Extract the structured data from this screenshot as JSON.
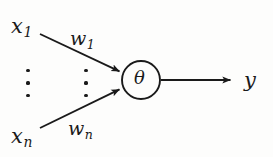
{
  "figure": {
    "kind": "neuron-diagram",
    "caption": "",
    "background_color": "#fdfdfc",
    "ink_color": "#1a1a1a"
  },
  "inputs": {
    "first": {
      "base": "x",
      "subscript": "1"
    },
    "last": {
      "base": "x",
      "subscript": "n"
    },
    "ellipsis_dots": 3
  },
  "weights": {
    "first": {
      "base": "w",
      "subscript": "1"
    },
    "last": {
      "base": "w",
      "subscript": "n"
    },
    "ellipsis_dots": 3
  },
  "node": {
    "symbol": "θ",
    "shape": "circle",
    "center_x": 141,
    "center_y": 80,
    "radius": 19
  },
  "output": {
    "symbol": "y"
  },
  "edges": [
    {
      "name": "input-1-to-node",
      "from_x": 40,
      "from_y": 34,
      "to_x": 121,
      "to_y": 72,
      "arrowhead": true
    },
    {
      "name": "input-n-to-node",
      "from_x": 40,
      "from_y": 128,
      "to_x": 121,
      "to_y": 89,
      "arrowhead": true
    },
    {
      "name": "node-to-output",
      "from_x": 161,
      "from_y": 80,
      "to_x": 233,
      "to_y": 80,
      "arrowhead": true
    }
  ]
}
